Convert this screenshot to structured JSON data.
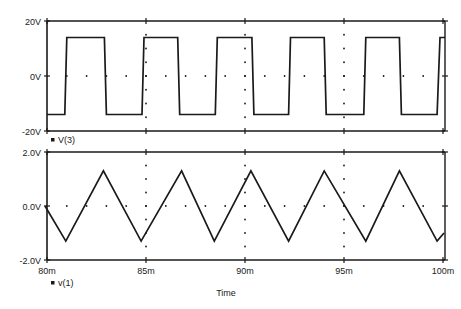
{
  "chart_data": [
    {
      "type": "line",
      "title": "",
      "legend": "V(3)",
      "xlabel": "Time",
      "ylabel": "",
      "ylim": [
        -20,
        20
      ],
      "y_ticks": [
        "20V",
        "0V",
        "-20V"
      ],
      "x_ticks": [
        "80m",
        "85m",
        "90m",
        "95m",
        "100m"
      ],
      "xlim_ms": [
        80,
        100
      ],
      "grid": "dotted",
      "series": [
        {
          "name": "V(3)",
          "waveform": "square",
          "high": 14,
          "low": -14,
          "points_ms_v": [
            [
              80.0,
              -14
            ],
            [
              80.9,
              -14
            ],
            [
              81.0,
              14
            ],
            [
              82.9,
              14
            ],
            [
              83.0,
              -14
            ],
            [
              84.8,
              -14
            ],
            [
              84.9,
              14
            ],
            [
              86.6,
              14
            ],
            [
              86.7,
              -14
            ],
            [
              88.5,
              -14
            ],
            [
              88.6,
              14
            ],
            [
              90.35,
              14
            ],
            [
              90.45,
              -14
            ],
            [
              92.2,
              -14
            ],
            [
              92.3,
              14
            ],
            [
              94.0,
              14
            ],
            [
              94.1,
              -14
            ],
            [
              96.0,
              -14
            ],
            [
              96.1,
              14
            ],
            [
              97.8,
              14
            ],
            [
              97.9,
              -14
            ],
            [
              99.7,
              -14
            ],
            [
              99.85,
              14
            ],
            [
              100.1,
              14
            ]
          ]
        }
      ]
    },
    {
      "type": "line",
      "title": "",
      "legend": "v(1)",
      "xlabel": "Time",
      "ylabel": "",
      "ylim": [
        -2.0,
        2.0
      ],
      "y_ticks": [
        "2.0V",
        "0.0V",
        "-2.0V"
      ],
      "x_ticks": [
        "80m",
        "85m",
        "90m",
        "95m",
        "100m"
      ],
      "xlim_ms": [
        80,
        100
      ],
      "grid": "dotted",
      "series": [
        {
          "name": "v(1)",
          "waveform": "triangle",
          "peak": 1.3,
          "trough": -1.3,
          "points_ms_v": [
            [
              79.9,
              0.0
            ],
            [
              80.95,
              -1.3
            ],
            [
              82.85,
              1.3
            ],
            [
              84.75,
              -1.3
            ],
            [
              86.8,
              1.3
            ],
            [
              88.45,
              -1.3
            ],
            [
              90.3,
              1.3
            ],
            [
              92.2,
              -1.3
            ],
            [
              94.0,
              1.3
            ],
            [
              96.1,
              -1.3
            ],
            [
              97.8,
              1.3
            ],
            [
              99.7,
              -1.3
            ],
            [
              100.05,
              -1.0
            ]
          ]
        }
      ]
    }
  ],
  "labels": {
    "top_legend": "V(3)",
    "bottom_legend": "v(1)",
    "x_axis_title": "Time"
  }
}
